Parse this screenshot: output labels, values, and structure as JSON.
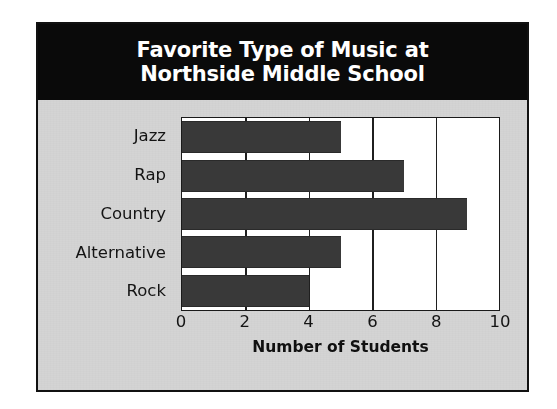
{
  "card": {
    "title": "Favorite Type of Music at\nNorthside Middle School",
    "title_band_color": "#0a0a0a",
    "title_text_color": "#ffffff",
    "background_color": "#d4d4d4",
    "border_color": "#111111"
  },
  "chart_data": {
    "type": "bar",
    "orientation": "horizontal",
    "title": "Favorite Type of Music at Northside Middle School",
    "categories": [
      "Jazz",
      "Rap",
      "Country",
      "Alternative",
      "Rock"
    ],
    "values": [
      5,
      7,
      9,
      5,
      4
    ],
    "xlabel": "Number of Students",
    "ylabel": "",
    "xlim": [
      0,
      10
    ],
    "xticks": [
      0,
      2,
      4,
      6,
      8,
      10
    ],
    "xtick_labels": [
      "0",
      "2",
      "4",
      "6",
      "8",
      "10"
    ],
    "grid": true,
    "grid_axis": "x",
    "legend": false,
    "bar_color": "#393939",
    "plot_background": "#ffffff",
    "axis_color": "#1a1a1a"
  }
}
